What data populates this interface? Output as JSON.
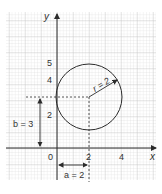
{
  "diagram": {
    "type": "circle-on-grid",
    "axes": {
      "x_label": "x",
      "y_label": "y",
      "origin_label": "0",
      "x_ticks": [
        "2",
        "4"
      ],
      "y_ticks": [
        "2",
        "4",
        "5"
      ]
    },
    "circle": {
      "center": [
        2,
        3
      ],
      "radius": 2,
      "radius_label": "r = 2"
    },
    "annotations": {
      "a_label": "a = 2",
      "b_label": "b = 3"
    },
    "colors": {
      "grid_minor": "#d6d6d6",
      "grid_major": "#bdbdbd",
      "ink": "#2b2b2b"
    }
  }
}
